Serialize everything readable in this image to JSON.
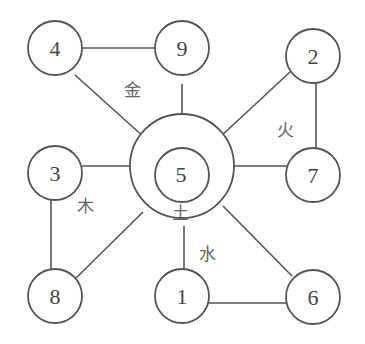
{
  "diagram": {
    "type": "luoshu-five-elements",
    "center": {
      "number": "5",
      "element": "土"
    },
    "nodes": [
      {
        "id": "n4",
        "number": "4",
        "x": 55,
        "y": 57
      },
      {
        "id": "n9",
        "number": "9",
        "x": 182,
        "y": 57
      },
      {
        "id": "n2",
        "number": "2",
        "x": 313,
        "y": 57
      },
      {
        "id": "n3",
        "number": "3",
        "x": 55,
        "y": 171
      },
      {
        "id": "n7",
        "number": "7",
        "x": 313,
        "y": 172
      },
      {
        "id": "n8",
        "number": "8",
        "x": 55,
        "y": 297
      },
      {
        "id": "n1",
        "number": "1",
        "x": 182,
        "y": 297
      },
      {
        "id": "n6",
        "number": "6",
        "x": 313,
        "y": 297
      }
    ],
    "elements": [
      {
        "name": "金",
        "numbers": [
          "4",
          "9"
        ]
      },
      {
        "name": "火",
        "numbers": [
          "2",
          "7"
        ]
      },
      {
        "name": "木",
        "numbers": [
          "3",
          "8"
        ]
      },
      {
        "name": "水",
        "numbers": [
          "1",
          "6"
        ]
      },
      {
        "name": "土",
        "numbers": [
          "5"
        ]
      }
    ],
    "labels": {
      "metal": "金",
      "fire": "火",
      "wood": "木",
      "water": "水",
      "earth": "土"
    }
  }
}
